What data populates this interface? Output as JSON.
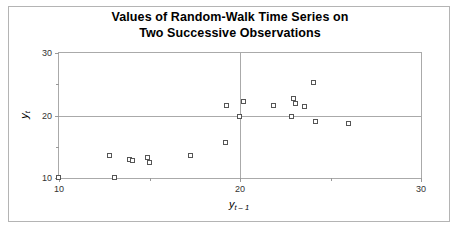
{
  "figure": {
    "title_line1": "Values of Random-Walk Time Series on",
    "title_line2": "Two Successive Observations",
    "frame_color": "#b4b4b4",
    "axis_color": "#aaaaaa",
    "marker_color": "#555555",
    "background": "#ffffff"
  },
  "axis": {
    "y_label_base": "y",
    "y_label_sub": "t",
    "x_label_base": "y",
    "x_label_sub": "t – 1",
    "x_ticks": [
      "10",
      "20",
      "30"
    ],
    "y_ticks": [
      "10",
      "20",
      "30"
    ]
  },
  "chart_data": {
    "type": "scatter",
    "title": "Values of Random-Walk Time Series on Two Successive Observations",
    "xlabel": "y t-1",
    "ylabel": "y t",
    "xlim": [
      10,
      30
    ],
    "ylim": [
      10,
      30
    ],
    "xticks": [
      10,
      20,
      30
    ],
    "yticks": [
      10,
      20,
      30
    ],
    "grid": true,
    "legend": null,
    "marker": "open-square",
    "series": [
      {
        "name": "successive observations",
        "points": [
          [
            10.0,
            10.0
          ],
          [
            13.1,
            10.0
          ],
          [
            12.8,
            13.6
          ],
          [
            13.9,
            12.9
          ],
          [
            14.1,
            12.8
          ],
          [
            14.9,
            13.2
          ],
          [
            15.0,
            12.4
          ],
          [
            17.3,
            13.6
          ],
          [
            19.2,
            15.6
          ],
          [
            19.3,
            21.5
          ],
          [
            20.2,
            22.1
          ],
          [
            20.0,
            19.8
          ],
          [
            21.9,
            21.6
          ],
          [
            23.0,
            22.6
          ],
          [
            23.1,
            21.8
          ],
          [
            23.6,
            21.4
          ],
          [
            22.9,
            19.8
          ],
          [
            24.1,
            25.2
          ],
          [
            24.2,
            18.9
          ],
          [
            26.0,
            18.6
          ]
        ]
      }
    ]
  }
}
